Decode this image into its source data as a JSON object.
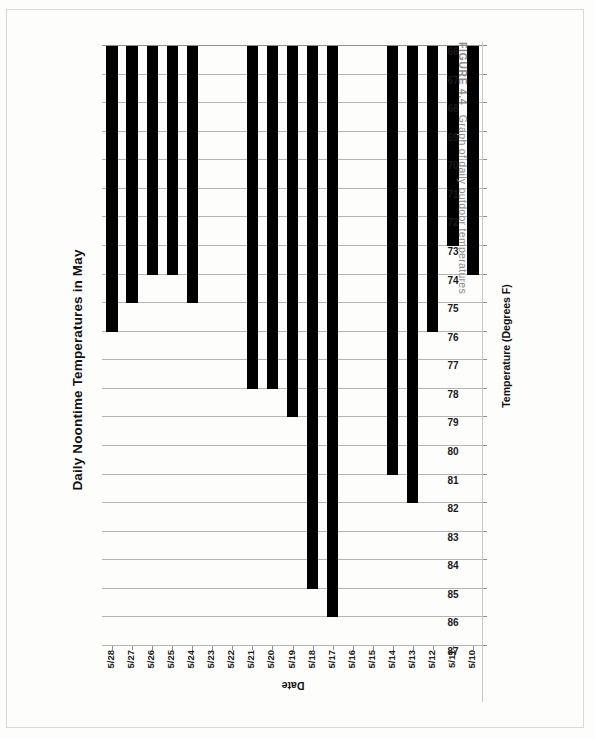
{
  "figure": {
    "caption_label": "FIGURE 4.4",
    "caption_text": "Graph of daily outdoor temperatures"
  },
  "chart_data": {
    "type": "bar",
    "orientation": "horizontal",
    "title": "Daily Noontime Temperatures in May",
    "xlabel": "Temperature (Degrees F)",
    "ylabel": "Date",
    "categories": [
      "5/10",
      "5/11",
      "5/12",
      "5/13",
      "5/14",
      "5/15",
      "5/16",
      "5/17",
      "5/18",
      "5/19",
      "5/20",
      "5/21",
      "5/22",
      "5/23",
      "5/24",
      "5/25",
      "5/26",
      "5/27",
      "5/28"
    ],
    "values": [
      74,
      73,
      76,
      82,
      81,
      null,
      null,
      86,
      85,
      79,
      78,
      78,
      null,
      null,
      75,
      74,
      74,
      75,
      76
    ],
    "value_axis_ticks": [
      87,
      86,
      85,
      84,
      83,
      82,
      81,
      80,
      79,
      78,
      77,
      76,
      75,
      74,
      73,
      72,
      71,
      70,
      69,
      68,
      67,
      66
    ],
    "value_axis_min": 66,
    "value_axis_max": 87,
    "value_axis_reversed": true,
    "grid": true,
    "legend": "none",
    "bar_color": "#000000"
  }
}
